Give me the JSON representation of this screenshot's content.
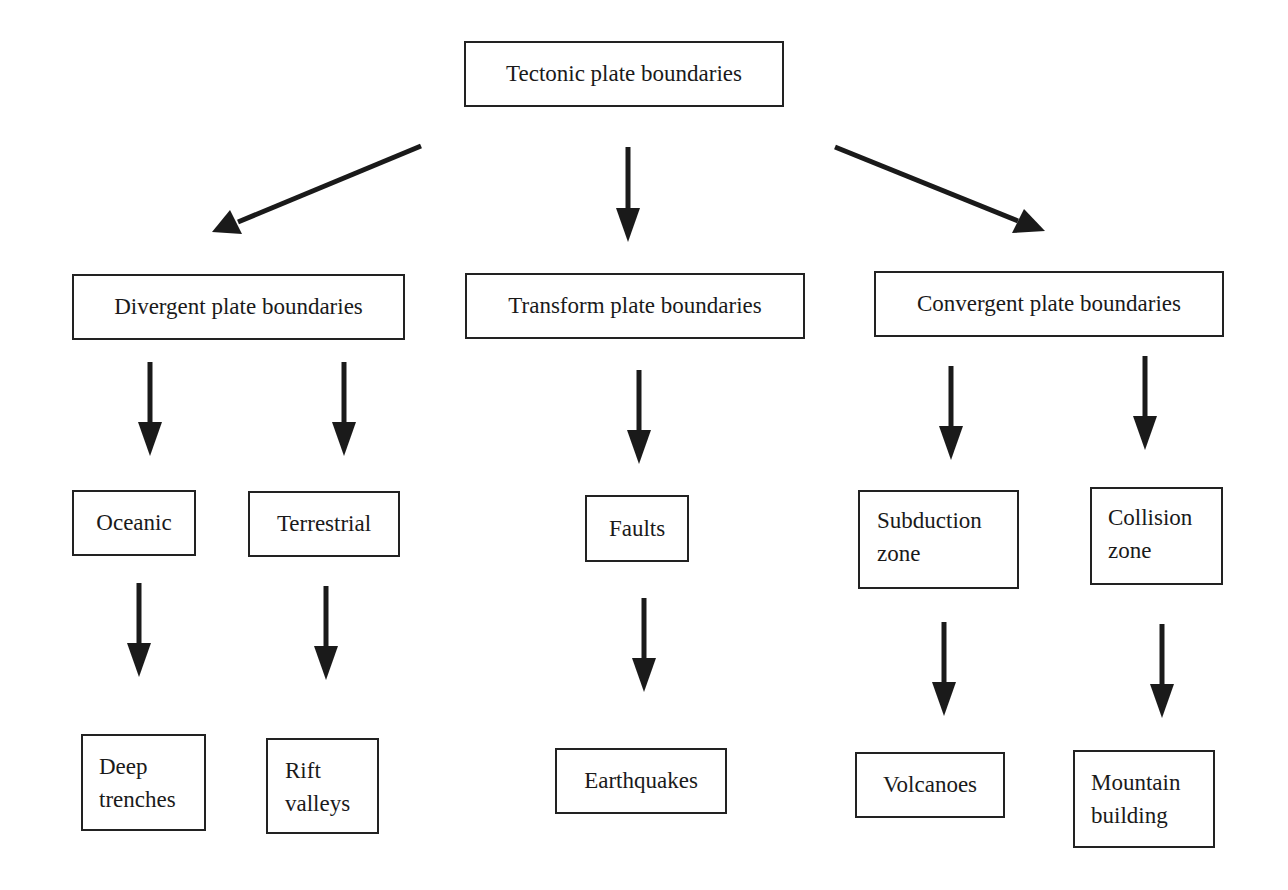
{
  "diagram": {
    "root": {
      "label": "Tectonic plate boundaries"
    },
    "categories": [
      {
        "label": "Divergent plate boundaries",
        "children": [
          {
            "label": "Oceanic",
            "result": [
              "Deep",
              "trenches"
            ]
          },
          {
            "label": "Terrestrial",
            "result": [
              "Rift",
              "valleys"
            ]
          }
        ]
      },
      {
        "label": "Transform plate boundaries",
        "children": [
          {
            "label": "Faults",
            "result": [
              "Earthquakes"
            ]
          }
        ]
      },
      {
        "label": "Convergent plate boundaries",
        "children": [
          {
            "label": [
              "Subduction",
              "zone"
            ],
            "result": [
              "Volcanoes"
            ]
          },
          {
            "label": [
              "Collision",
              "zone"
            ],
            "result": [
              "Mountain",
              "building"
            ]
          }
        ]
      }
    ],
    "colors": {
      "stroke": "#222222",
      "background": "#ffffff",
      "text": "#1a1a1a"
    }
  }
}
